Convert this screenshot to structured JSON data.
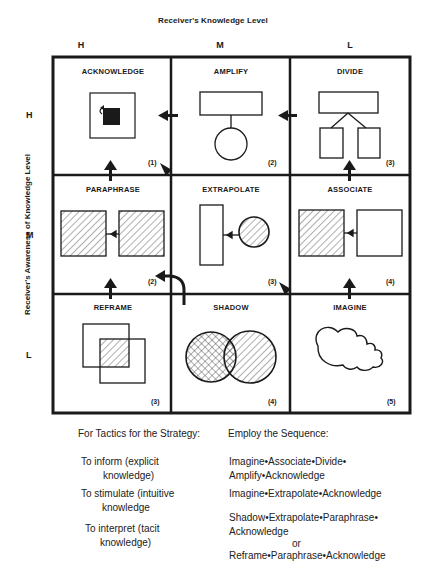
{
  "title_top": "Receiver's Knowledge Level",
  "title_side": "Receiver's Awareness of Knowledge Level",
  "columns": [
    "H",
    "M",
    "L"
  ],
  "rows": [
    "H",
    "M",
    "L"
  ],
  "cells": [
    {
      "name": "ACKNOWLEDGE",
      "num": "(1)",
      "row": "H",
      "col": "H"
    },
    {
      "name": "AMPLIFY",
      "num": "(2)",
      "row": "H",
      "col": "M"
    },
    {
      "name": "DIVIDE",
      "num": "(3)",
      "row": "H",
      "col": "L"
    },
    {
      "name": "PARAPHRASE",
      "num": "(2)",
      "row": "M",
      "col": "H"
    },
    {
      "name": "EXTRAPOLATE",
      "num": "(3)",
      "row": "M",
      "col": "M"
    },
    {
      "name": "ASSOCIATE",
      "num": "(4)",
      "row": "M",
      "col": "L"
    },
    {
      "name": "REFRAME",
      "num": "(3)",
      "row": "L",
      "col": "H"
    },
    {
      "name": "SHADOW",
      "num": "(4)",
      "row": "L",
      "col": "M"
    },
    {
      "name": "IMAGINE",
      "num": "(5)",
      "row": "L",
      "col": "L"
    }
  ],
  "table": {
    "header_left": "For Tactics for the Strategy:",
    "header_right": "Employ the Sequence:",
    "rows": [
      {
        "left1": "To inform (explicit",
        "left2": "knowledge)",
        "right1": "Imagine•Associate•Divide•",
        "right2": "Amplify•Acknowledge"
      },
      {
        "left1": "To stimulate (intuitive",
        "left2": "knowledge",
        "right1": "Imagine•Extrapolate•Acknowledge",
        "right2": ""
      },
      {
        "left1": "To interpret (tacit",
        "left2": "knowledge)",
        "right1": "Shadow•Extrapolate•Paraphrase•",
        "right2": "Acknowledge",
        "or": "or",
        "right3": "Reframe•Paraphrase•Acknowledge"
      }
    ]
  },
  "colors": {
    "line": "#1a1a1a",
    "background": "#ffffff"
  }
}
